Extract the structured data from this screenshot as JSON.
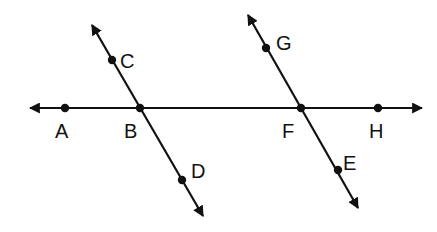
{
  "diagram": {
    "stroke_color": "#111111",
    "background": "#ffffff",
    "lines": [
      {
        "name": "AH",
        "from": [
          30,
          108
        ],
        "to": [
          422,
          108
        ],
        "arrows": "both"
      },
      {
        "name": "CD",
        "from": [
          92,
          25
        ],
        "to": [
          203,
          216
        ],
        "arrows": "both"
      },
      {
        "name": "GE",
        "from": [
          248,
          15
        ],
        "to": [
          358,
          208
        ],
        "arrows": "both"
      }
    ],
    "points": [
      {
        "label": "A",
        "x": 65,
        "y": 108,
        "lx": 55,
        "ly": 138
      },
      {
        "label": "B",
        "x": 140,
        "y": 108,
        "lx": 124,
        "ly": 138
      },
      {
        "label": "C",
        "x": 112,
        "y": 60,
        "lx": 120,
        "ly": 68
      },
      {
        "label": "D",
        "x": 182,
        "y": 180,
        "lx": 191,
        "ly": 178
      },
      {
        "label": "G",
        "x": 266,
        "y": 48,
        "lx": 276,
        "ly": 50
      },
      {
        "label": "F",
        "x": 301,
        "y": 108,
        "lx": 282,
        "ly": 138
      },
      {
        "label": "E",
        "x": 338,
        "y": 170,
        "lx": 343,
        "ly": 170
      },
      {
        "label": "H",
        "x": 378,
        "y": 108,
        "lx": 369,
        "ly": 138
      }
    ]
  }
}
